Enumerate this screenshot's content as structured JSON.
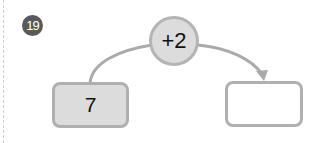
{
  "problem": {
    "number": "19"
  },
  "diagram": {
    "operation": "+2",
    "input_value": "7",
    "output_value": "",
    "colors": {
      "badge": "#5a5a5a",
      "shape_fill": "#dcdcdc",
      "border": "#b0b0b0",
      "connector": "#aaaaaa"
    }
  }
}
